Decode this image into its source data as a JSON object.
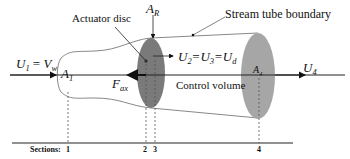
{
  "diagram": {
    "title_labels": {
      "actuator_disc": "Actuator disc",
      "stream_tube_boundary": "Stream tube boundary",
      "control_volume": "Control volume"
    },
    "symbols": {
      "a_r": {
        "base": "A",
        "sub": "R"
      },
      "u1_vw": {
        "left_base": "U",
        "left_sub": "1",
        "eq": " = ",
        "right_base": "V",
        "right_sub": "w"
      },
      "a1": {
        "base": "A",
        "sub": "1"
      },
      "f_ax": {
        "base": "F",
        "sub": "ax"
      },
      "u2_u3_ud": {
        "b1": "U",
        "s1": "2",
        "b2": "=U",
        "s2": "3",
        "b3": "=U",
        "s3": "d"
      },
      "a4": {
        "base": "A",
        "sub": "4"
      },
      "u4": {
        "base": "U",
        "sub": "4"
      }
    },
    "sections": {
      "label": "Sections:",
      "numbers": [
        "1",
        "2",
        "3",
        "4"
      ]
    },
    "colors": {
      "line": "#222222",
      "disc_rotor": "#7a7a7a",
      "disc_far": "#a6a6a6",
      "tube": "#888888"
    }
  }
}
